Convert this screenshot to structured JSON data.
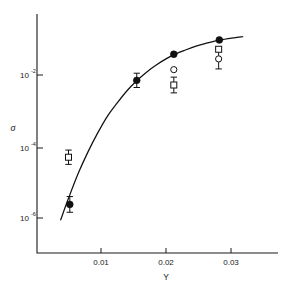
{
  "chart_data": {
    "type": "scatter",
    "title": "",
    "xlabel": "Y",
    "ylabel": "σ",
    "xlim": [
      0.0035,
      0.0335
    ],
    "ylim_log10": [
      -7.0,
      1.2
    ],
    "grid": false,
    "legend_position": "none",
    "xticks": [
      0.01,
      0.02,
      0.03
    ],
    "xtick_labels": [
      "0.01",
      "0.02",
      "0.03"
    ],
    "yticks_log10": [
      -2,
      -4,
      -6
    ],
    "ytick_labels": [
      "10",
      "10",
      "10"
    ],
    "ytick_exponents": [
      "-2",
      "-4",
      "-6"
    ],
    "yscale": "log",
    "series": [
      {
        "name": "filled-circle",
        "marker": "filled-circle",
        "x": [
          0.0052,
          0.0155,
          0.0212,
          0.0282
        ],
        "y_log10": [
          -5.62,
          -2.15,
          -1.42,
          -1.02
        ],
        "yerr_log10": [
          0.22,
          0.2,
          0.0,
          0.0
        ]
      },
      {
        "name": "open-square",
        "marker": "open-square",
        "x": [
          0.005,
          0.0212,
          0.0281
        ],
        "y_log10": [
          -4.3,
          -2.28,
          -1.28
        ],
        "yerr_log10": [
          0.2,
          0.22,
          0.0
        ]
      },
      {
        "name": "open-circle",
        "marker": "open-circle",
        "x": [
          0.0212,
          0.0281
        ],
        "y_log10": [
          -1.85,
          -1.55
        ],
        "yerr_log10": [
          0.0,
          0.28
        ]
      }
    ],
    "curve": {
      "name": "model-fit",
      "style": "solid",
      "x": [
        0.0038,
        0.005,
        0.0065,
        0.008,
        0.0095,
        0.011,
        0.0125,
        0.014,
        0.0155,
        0.017,
        0.0185,
        0.02,
        0.0215,
        0.023,
        0.0245,
        0.026,
        0.0275,
        0.029,
        0.0305,
        0.0318
      ],
      "y_log10": [
        -6.05,
        -5.45,
        -4.75,
        -4.15,
        -3.62,
        -3.15,
        -2.78,
        -2.44,
        -2.16,
        -1.92,
        -1.72,
        -1.55,
        -1.41,
        -1.3,
        -1.2,
        -1.12,
        -1.05,
        -1.0,
        -0.96,
        -0.93
      ]
    }
  },
  "geometry": {
    "plot_left": 37,
    "plot_right": 278,
    "plot_top": 14,
    "plot_bottom": 253,
    "x_pixel_per_unit": 6500,
    "x_origin_value": 0.00138,
    "y_tick_pixels": [
      75,
      148,
      218
    ]
  }
}
